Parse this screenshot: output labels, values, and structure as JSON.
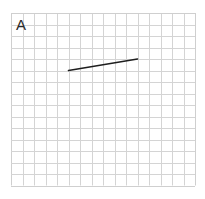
{
  "figure": {
    "panel_label": "A",
    "grid": {
      "left": 11,
      "top": 13,
      "cell": 11.5,
      "cols": 16,
      "rows": 15,
      "line_color": "#d4d4d4",
      "border_color": "#cfcfcf"
    },
    "segments": [
      {
        "from": [
          5,
          5
        ],
        "to": [
          11,
          4
        ],
        "color": "#1e1e1e",
        "width": 1.6
      }
    ]
  }
}
